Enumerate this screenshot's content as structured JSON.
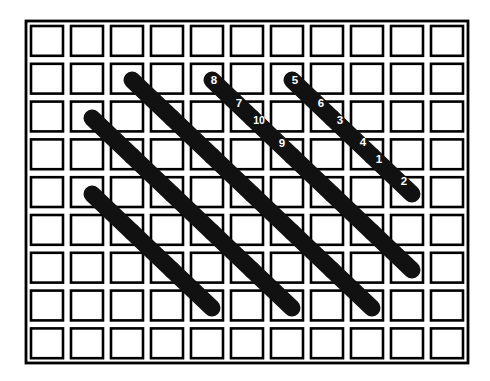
{
  "figure": {
    "background_color": "#ffffff",
    "line_color": "#000000",
    "domino_color": "#111111",
    "label_color": "#ffffff"
  },
  "grid": {
    "columns": 11,
    "rows": 9,
    "origin_x": 27,
    "origin_y": 22,
    "cell_pitch_x": 40.0,
    "cell_pitch_y": 37.8,
    "cell_inset": 4.0,
    "frame": {
      "x": 26,
      "y": 21,
      "width": 442,
      "height": 342
    }
  },
  "dominoes": [
    {
      "id": "d1",
      "x1": 132,
      "y1": 80,
      "x2": 172,
      "y2": 118,
      "label_a": null,
      "label_b": null
    },
    {
      "id": "d2",
      "x1": 92,
      "y1": 118,
      "x2": 132,
      "y2": 156,
      "label_a": null,
      "label_b": null
    },
    {
      "id": "d3",
      "x1": 172,
      "y1": 118,
      "x2": 212,
      "y2": 156,
      "label_a": null,
      "label_b": null
    },
    {
      "id": "d4",
      "x1": 212,
      "y1": 80,
      "x2": 252,
      "y2": 118,
      "label_a": "8",
      "label_b": "7"
    },
    {
      "id": "d5",
      "x1": 292,
      "y1": 80,
      "x2": 332,
      "y2": 118,
      "label_a": "5",
      "label_b": "6"
    },
    {
      "id": "d6",
      "x1": 252,
      "y1": 118,
      "x2": 292,
      "y2": 156,
      "label_a": "10",
      "label_b": "9"
    },
    {
      "id": "d7",
      "x1": 332,
      "y1": 118,
      "x2": 372,
      "y2": 156,
      "label_a": "3",
      "label_b": "4"
    },
    {
      "id": "d8",
      "x1": 372,
      "y1": 156,
      "x2": 412,
      "y2": 194,
      "label_a": "1",
      "label_b": "2"
    },
    {
      "id": "d9",
      "x1": 132,
      "y1": 156,
      "x2": 172,
      "y2": 194,
      "label_a": null,
      "label_b": null
    },
    {
      "id": "d10",
      "x1": 212,
      "y1": 156,
      "x2": 252,
      "y2": 194,
      "label_a": null,
      "label_b": null
    },
    {
      "id": "d11",
      "x1": 292,
      "y1": 156,
      "x2": 332,
      "y2": 194,
      "label_a": null,
      "label_b": null
    },
    {
      "id": "d12",
      "x1": 92,
      "y1": 194,
      "x2": 132,
      "y2": 232,
      "label_a": null,
      "label_b": null
    },
    {
      "id": "d13",
      "x1": 172,
      "y1": 194,
      "x2": 212,
      "y2": 232,
      "label_a": null,
      "label_b": null
    },
    {
      "id": "d14",
      "x1": 252,
      "y1": 194,
      "x2": 292,
      "y2": 232,
      "label_a": null,
      "label_b": null
    },
    {
      "id": "d15",
      "x1": 332,
      "y1": 194,
      "x2": 372,
      "y2": 232,
      "label_a": null,
      "label_b": null
    },
    {
      "id": "d16",
      "x1": 132,
      "y1": 232,
      "x2": 172,
      "y2": 270,
      "label_a": null,
      "label_b": null
    },
    {
      "id": "d17",
      "x1": 212,
      "y1": 232,
      "x2": 252,
      "y2": 270,
      "label_a": null,
      "label_b": null
    },
    {
      "id": "d18",
      "x1": 292,
      "y1": 232,
      "x2": 332,
      "y2": 270,
      "label_a": null,
      "label_b": null
    },
    {
      "id": "d19",
      "x1": 372,
      "y1": 232,
      "x2": 412,
      "y2": 270,
      "label_a": null,
      "label_b": null
    },
    {
      "id": "d20",
      "x1": 172,
      "y1": 270,
      "x2": 212,
      "y2": 308,
      "label_a": null,
      "label_b": null
    },
    {
      "id": "d21",
      "x1": 252,
      "y1": 270,
      "x2": 292,
      "y2": 308,
      "label_a": null,
      "label_b": null
    },
    {
      "id": "d22",
      "x1": 332,
      "y1": 270,
      "x2": 372,
      "y2": 308,
      "label_a": null,
      "label_b": null
    }
  ],
  "labels": [
    {
      "text": "8",
      "x": 214,
      "y": 80
    },
    {
      "text": "7",
      "x": 239,
      "y": 103
    },
    {
      "text": "5",
      "x": 295,
      "y": 80
    },
    {
      "text": "6",
      "x": 321,
      "y": 103
    },
    {
      "text": "10",
      "x": 259,
      "y": 120
    },
    {
      "text": "9",
      "x": 282,
      "y": 143
    },
    {
      "text": "3",
      "x": 340,
      "y": 120
    },
    {
      "text": "4",
      "x": 363,
      "y": 142
    },
    {
      "text": "1",
      "x": 379,
      "y": 159
    },
    {
      "text": "2",
      "x": 404,
      "y": 181
    }
  ],
  "domino_style": {
    "stroke_width": 17
  }
}
